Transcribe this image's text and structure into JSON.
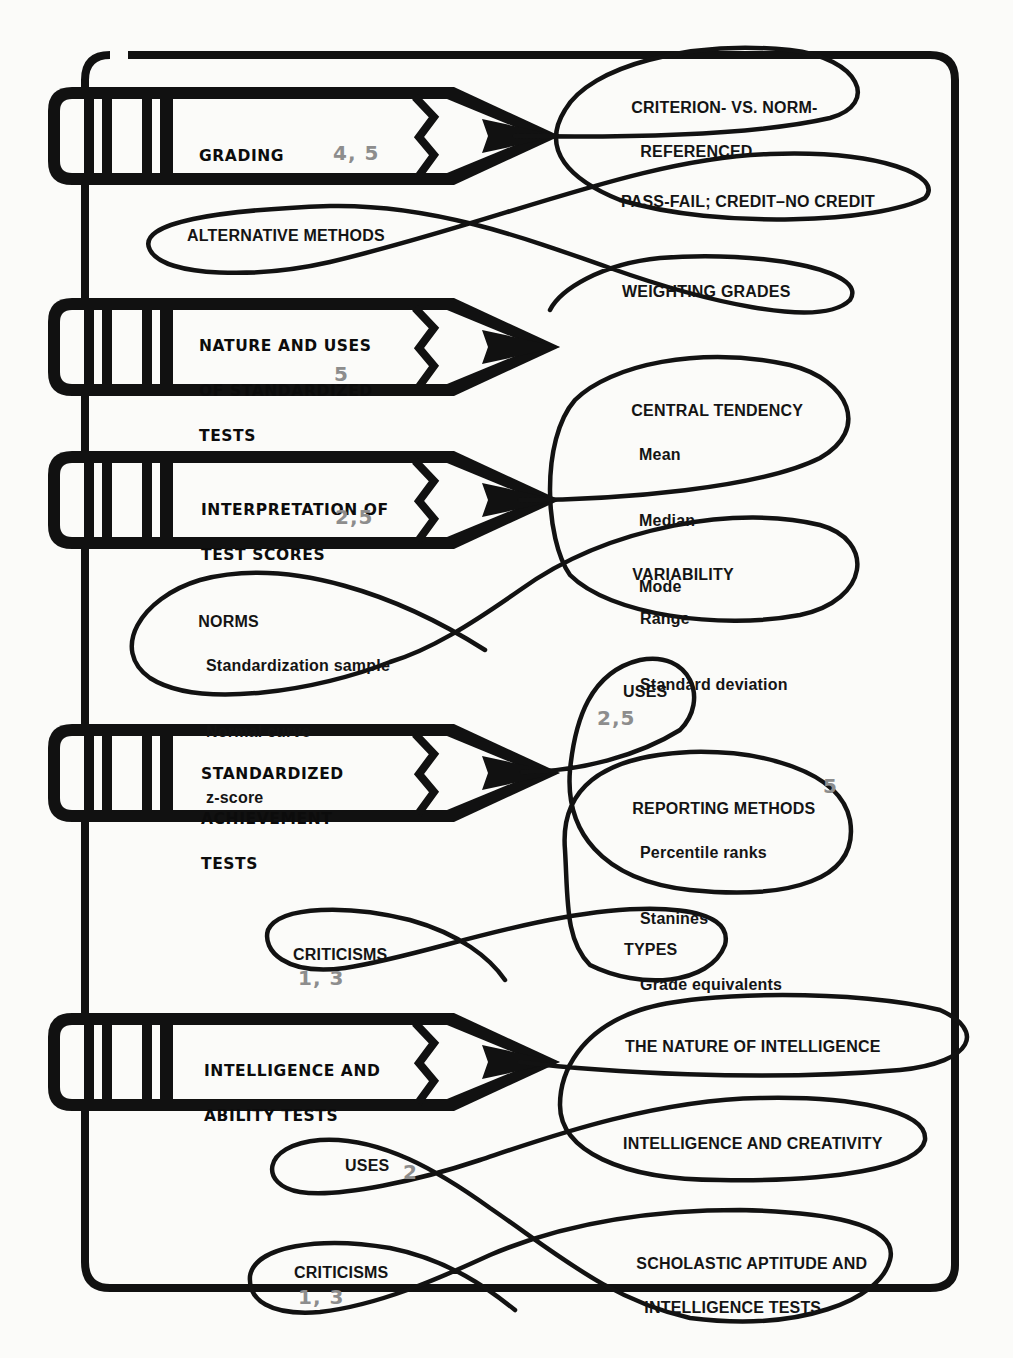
{
  "colors": {
    "ink": "#111111",
    "chapter_ref": "#8d8d8d",
    "paper": "#fbfbf9"
  },
  "topics": [
    {
      "title_lines": [
        "GRADING"
      ],
      "chapter_refs": "4, 5",
      "branches": [
        {
          "label_lines": [
            "CRITERION- VS. NORM-",
            "REFERENCED"
          ]
        },
        {
          "label_lines": [
            "PASS-FAIL; CREDIT–NO CREDIT"
          ]
        },
        {
          "label_lines": [
            "WEIGHTING GRADES"
          ]
        },
        {
          "label_lines": [
            "ALTERNATIVE METHODS"
          ]
        }
      ]
    },
    {
      "title_lines": [
        "NATURE AND USES",
        "OF STANDARDIZED",
        "TESTS"
      ],
      "chapter_refs": "5",
      "branches": []
    },
    {
      "title_lines": [
        "INTERPRETATION OF",
        "TEST SCORES"
      ],
      "chapter_refs": "2,5",
      "branches": [
        {
          "label": "CENTRAL TENDENCY",
          "items": [
            "Mean",
            "Median",
            "Mode"
          ]
        },
        {
          "label": "VARIABILITY",
          "items": [
            "Range",
            "Standard deviation"
          ]
        },
        {
          "label": "NORMS",
          "items": [
            "Standardization sample",
            "Normal curve",
            "z-score"
          ]
        }
      ]
    },
    {
      "title_lines": [
        "STANDARDIZED",
        "ACHIEVEMENT",
        "TESTS"
      ],
      "chapter_refs": "",
      "branches": [
        {
          "label": "USES",
          "chapter_refs": "2,5"
        },
        {
          "label": "REPORTING METHODS",
          "chapter_refs": "5",
          "items": [
            "Percentile ranks",
            "Stanines",
            "Grade equivalents"
          ]
        },
        {
          "label": "TYPES"
        },
        {
          "label": "CRITICISMS",
          "chapter_refs": "1, 3"
        }
      ]
    },
    {
      "title_lines": [
        "INTELLIGENCE AND",
        "ABILITY TESTS"
      ],
      "chapter_refs": "",
      "branches": [
        {
          "label_lines": [
            "THE NATURE OF INTELLIGENCE"
          ]
        },
        {
          "label_lines": [
            "INTELLIGENCE AND CREATIVITY"
          ]
        },
        {
          "label_lines": [
            "SCHOLASTIC APTITUDE AND",
            "INTELLIGENCE TESTS"
          ]
        },
        {
          "label": "USES",
          "chapter_refs": "2"
        },
        {
          "label": "CRITICISMS",
          "chapter_refs": "1, 3"
        }
      ]
    }
  ]
}
